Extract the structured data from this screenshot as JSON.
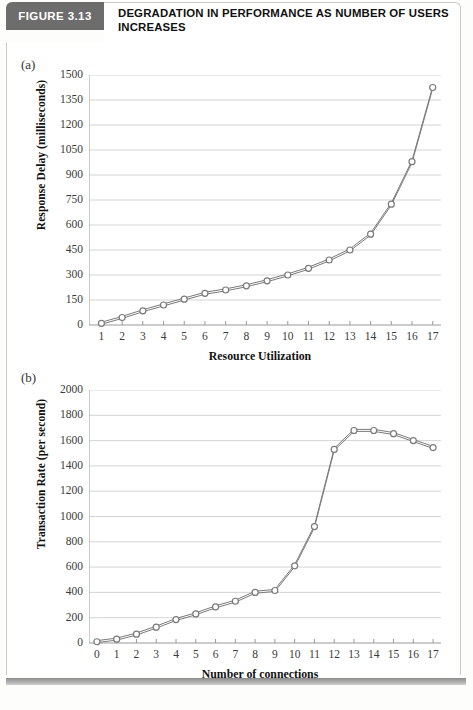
{
  "header": {
    "figure_tab": "FIGURE 3.13",
    "title": "DEGRADATION IN PERFORMANCE AS NUMBER OF USERS INCREASES"
  },
  "panels": {
    "a": {
      "letter": "(a)"
    },
    "b": {
      "letter": "(b)"
    }
  },
  "colors": {
    "tab_background": "#6d6d6d",
    "tab_text": "#ffffff",
    "grid": "#cfcfcf",
    "axis": "#9a9a9a",
    "series": "#7a7a7a",
    "marker_fill": "#ffffff",
    "footer_bar": "#8c8c8c"
  },
  "chart_data": [
    {
      "type": "line",
      "panel": "(a)",
      "title": "",
      "xlabel": "Resource Utilization",
      "ylabel": "Response Delay (milliseconds)",
      "x": [
        1,
        2,
        3,
        4,
        5,
        6,
        7,
        8,
        9,
        10,
        11,
        12,
        13,
        14,
        15,
        16,
        17
      ],
      "values": [
        10,
        45,
        85,
        120,
        155,
        190,
        210,
        235,
        265,
        300,
        340,
        390,
        450,
        545,
        725,
        980,
        1425
      ],
      "xlim": [
        0.4,
        17.4
      ],
      "ylim": [
        0,
        1500
      ],
      "ytick_labels": [
        "0",
        "150",
        "300",
        "450",
        "600",
        "750",
        "900",
        "1050",
        "1200",
        "1350",
        "1500"
      ],
      "ytick_values": [
        0,
        150,
        300,
        450,
        600,
        750,
        900,
        1050,
        1200,
        1350,
        1500
      ],
      "xtick_labels": [
        "1",
        "2",
        "3",
        "4",
        "5",
        "6",
        "7",
        "8",
        "9",
        "10",
        "11",
        "12",
        "13",
        "14",
        "15",
        "16",
        "17"
      ],
      "grid": "horizontal",
      "legend": "none",
      "marker": "open-circle"
    },
    {
      "type": "line",
      "panel": "(b)",
      "title": "",
      "xlabel": "Number of connections",
      "ylabel": "Transaction Rate (per second)",
      "x": [
        0,
        1,
        2,
        3,
        4,
        5,
        6,
        7,
        8,
        9,
        10,
        11,
        12,
        13,
        14,
        15,
        16,
        17
      ],
      "values": [
        10,
        30,
        70,
        125,
        185,
        230,
        285,
        330,
        400,
        415,
        610,
        920,
        1530,
        1680,
        1680,
        1655,
        1600,
        1545,
        1470
      ],
      "xlim": [
        -0.4,
        17.4
      ],
      "ylim": [
        0,
        2000
      ],
      "ytick_labels": [
        "0",
        "200",
        "400",
        "600",
        "800",
        "1000",
        "1200",
        "1400",
        "1600",
        "1800",
        "2000"
      ],
      "ytick_values": [
        0,
        200,
        400,
        600,
        800,
        1000,
        1200,
        1400,
        1600,
        1800,
        2000
      ],
      "xtick_labels": [
        "0",
        "1",
        "2",
        "3",
        "4",
        "5",
        "6",
        "7",
        "8",
        "9",
        "10",
        "11",
        "12",
        "13",
        "14",
        "15",
        "16",
        "17"
      ],
      "grid": "horizontal",
      "legend": "none",
      "marker": "open-circle"
    }
  ]
}
